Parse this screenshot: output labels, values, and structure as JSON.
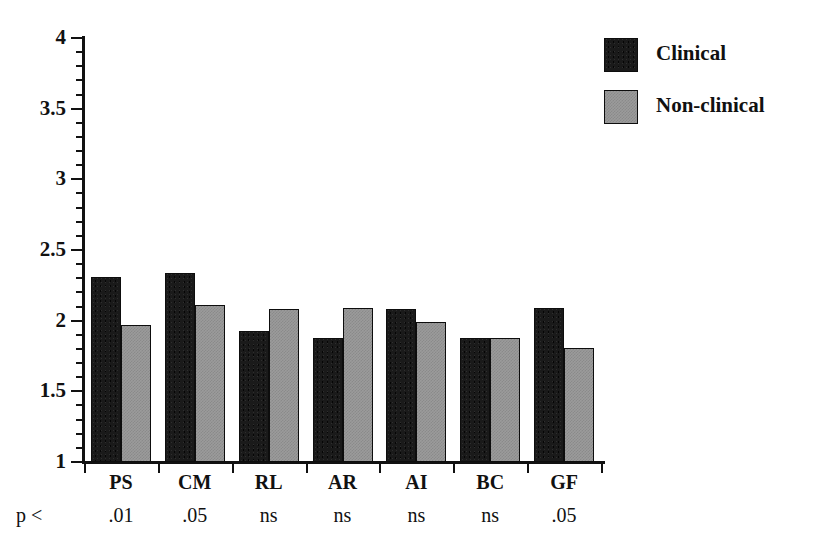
{
  "chart_data": {
    "type": "bar",
    "title": "",
    "xlabel": "",
    "ylabel": "",
    "ylim": [
      1,
      4
    ],
    "ytick_labels": [
      "1",
      "1.5",
      "2",
      "2.5",
      "3",
      "3.5",
      "4"
    ],
    "ytick_values": [
      1,
      1.5,
      2,
      2.5,
      3,
      3.5,
      4
    ],
    "yminor_step": 0.1,
    "grid": false,
    "legend_position": "top-right",
    "categories": [
      "PS",
      "CM",
      "RL",
      "AR",
      "AI",
      "BC",
      "GF"
    ],
    "series": [
      {
        "name": "Clinical",
        "color": "#1a1a1a",
        "values": [
          2.31,
          2.34,
          1.93,
          1.88,
          2.08,
          1.88,
          2.09
        ]
      },
      {
        "name": "Non-clinical",
        "color": "#9b9b9b",
        "values": [
          1.97,
          2.11,
          2.08,
          2.09,
          1.99,
          1.88,
          1.81
        ]
      }
    ],
    "annotations": {
      "p_prefix": "p <",
      "p_values": [
        ".01",
        ".05",
        "ns",
        "ns",
        "ns",
        "ns",
        ".05"
      ]
    }
  },
  "legend": {
    "items": [
      {
        "label": "Clinical",
        "swatch": "clinical-swatch"
      },
      {
        "label": "Non-clinical",
        "swatch": "nonclinical-swatch"
      }
    ]
  }
}
